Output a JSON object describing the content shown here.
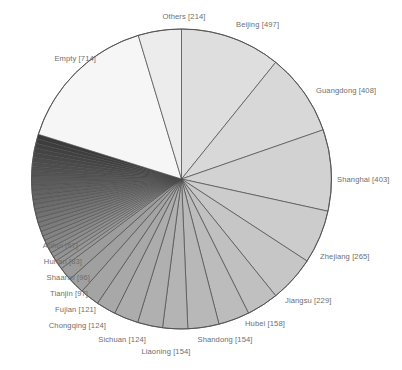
{
  "chart_data": {
    "type": "pie",
    "title": "",
    "subtitle": "",
    "xlabel": "",
    "ylabel": "",
    "legend_position": "none",
    "grid": false,
    "label_format": "{name} [{value}]",
    "start_angle_deg": 0,
    "direction": "clockwise",
    "sort": "descending",
    "labels": [
      "Beijing",
      "Guangdong",
      "Shanghai",
      "Zhejiang",
      "Jiangsu",
      "Hubei",
      "Shandong",
      "Liaoning",
      "Sichuan",
      "Chongqing",
      "Fujian",
      "Tianjin",
      "Shaanxi",
      "Hunan",
      "Anhui",
      "Empty",
      "Others"
    ],
    "values": [
      497,
      408,
      403,
      265,
      229,
      158,
      154,
      154,
      124,
      124,
      121,
      97,
      96,
      83,
      67,
      714,
      214
    ],
    "slices": [
      {
        "name": "Beijing",
        "value": 497,
        "label": "Beijing [497]",
        "color": "#dedede"
      },
      {
        "name": "Guangdong",
        "value": 408,
        "label": "Guangdong [408]",
        "color": "#d8d8d8"
      },
      {
        "name": "Shanghai",
        "value": 403,
        "label": "Shanghai [403]",
        "color": "#d2d2d2"
      },
      {
        "name": "Zhejiang",
        "value": 265,
        "label": "Zhejiang [265]",
        "color": "#cccccc"
      },
      {
        "name": "Jiangsu",
        "value": 229,
        "label": "Jiangsu [229]",
        "color": "#c6c6c6"
      },
      {
        "name": "Hubei",
        "value": 158,
        "label": "Hubei [158]",
        "color": "#c0c0c0"
      },
      {
        "name": "Shandong",
        "value": 154,
        "label": "Shandong [154]",
        "color": "#bcbcbc"
      },
      {
        "name": "Liaoning",
        "value": 154,
        "label": "Liaoning [154]",
        "color": "#b8b8b8"
      },
      {
        "name": "Sichuan",
        "value": 124,
        "label": "Sichuan [124]",
        "color": "#b4b4b4"
      },
      {
        "name": "Chongqing",
        "value": 124,
        "label": "Chongqing [124]",
        "color": "#b0b0b0"
      },
      {
        "name": "Fujian",
        "value": 121,
        "label": "Fujian [121]",
        "color": "#acacac"
      },
      {
        "name": "Tianjin",
        "value": 97,
        "label": "Tianjin [97]",
        "color": "#a8a8a8"
      },
      {
        "name": "Shaanxi",
        "value": 96,
        "label": "Shaanxi [96]",
        "color": "#a4a4a4"
      },
      {
        "name": "Hunan",
        "value": 83,
        "label": "Hunan [83]",
        "color": "#a0a0a0"
      },
      {
        "name": "Anhui",
        "value": 67,
        "label": "Anhui [67]",
        "color": "#9c9c9c"
      }
    ],
    "tail_slices": {
      "description": "unlabeled small-value slices forming dense dark band",
      "count": 30,
      "total_value": 690,
      "color_start": "#9a9a9a",
      "color_end": "#3a3a3a"
    },
    "large_slices": [
      {
        "name": "Empty",
        "value": 714,
        "label": "Empty [714]",
        "color": "#f6f6f6"
      },
      {
        "name": "Others",
        "value": 214,
        "label": "Others [214]",
        "color": "#ececec"
      }
    ],
    "total": 4538
  },
  "label_positions": [
    {
      "key": "Others",
      "x": 149,
      "y": 13,
      "align": "lbl-c",
      "width": 70
    },
    {
      "key": "Beijing",
      "x": 236,
      "y": 21,
      "align": "lbl-r",
      "width": 90
    },
    {
      "key": "Empty",
      "x": 16,
      "y": 55,
      "align": "lbl-l",
      "width": 80
    },
    {
      "key": "Guangdong",
      "x": 316,
      "y": 87,
      "align": "lbl-r",
      "width": 86
    },
    {
      "key": "Shanghai",
      "x": 337,
      "y": 176,
      "align": "lbl-r",
      "width": 65
    },
    {
      "key": "Zhejiang",
      "x": 320,
      "y": 253,
      "align": "lbl-r",
      "width": 82
    },
    {
      "key": "Jiangsu",
      "x": 285,
      "y": 297,
      "align": "lbl-r",
      "width": 90
    },
    {
      "key": "Hubei",
      "x": 245,
      "y": 320,
      "align": "lbl-r",
      "width": 78
    },
    {
      "key": "Shandong",
      "x": 182,
      "y": 336,
      "align": "lbl-c",
      "width": 86
    },
    {
      "key": "Liaoning",
      "x": 123,
      "y": 348,
      "align": "lbl-c",
      "width": 86
    },
    {
      "key": "Sichuan",
      "x": 60,
      "y": 336,
      "align": "lbl-l",
      "width": 86
    },
    {
      "key": "Chongqing",
      "x": 6,
      "y": 322,
      "align": "lbl-l",
      "width": 100
    },
    {
      "key": "Fujian",
      "x": 10,
      "y": 306,
      "align": "lbl-l",
      "width": 86
    },
    {
      "key": "Tianjin",
      "x": 6,
      "y": 290,
      "align": "lbl-l",
      "width": 82
    },
    {
      "key": "Shaanxi",
      "x": 2,
      "y": 274,
      "align": "lbl-l",
      "width": 88
    },
    {
      "key": "Hunan",
      "x": 2,
      "y": 258,
      "align": "lbl-l",
      "width": 80
    },
    {
      "key": "Anhui",
      "x": 2,
      "y": 242,
      "align": "lbl-l",
      "width": 76
    }
  ],
  "geometry": {
    "center_x": 181.5,
    "center_y": 179,
    "radius": 150
  }
}
